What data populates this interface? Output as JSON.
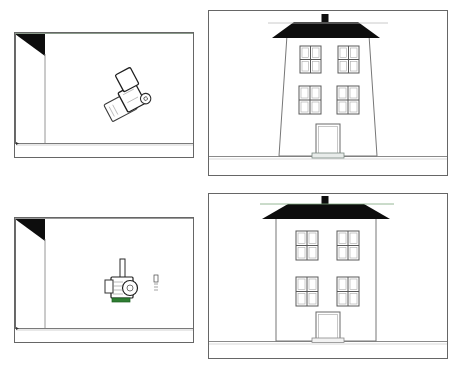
{
  "document": {
    "title": "Architectural Sketch Comparison Sheet",
    "background_color": "#ffffff",
    "width": 461,
    "height": 368,
    "line_color": "#555555",
    "ink_color": "#111111",
    "fill_color": "#ffffff"
  },
  "layout": {
    "columns": 2,
    "rows": 2,
    "description": "Four line-drawing viewport panels arranged in a 2x2 grid"
  },
  "panels": [
    {
      "id": "interior-top",
      "name": "Interior perspective view - top left",
      "kind": "interior-room",
      "row": 1,
      "column": 1,
      "x": 14,
      "y": 32,
      "width": 180,
      "height": 126,
      "border_color": "#666666",
      "features": {
        "corner_shadow": "black triangle at upper-left wall corner",
        "wall_edge_lines": 2,
        "floor_line_y_ratio": 0.88,
        "object": {
          "name": "furniture-sketch",
          "label": "rotated boxy object",
          "x_ratio": 0.62,
          "y_ratio": 0.58,
          "rotation_deg": -28
        }
      }
    },
    {
      "id": "exterior-top",
      "name": "House elevation - top right (tapered walls)",
      "kind": "house-elevation",
      "row": 1,
      "column": 2,
      "x": 208,
      "y": 10,
      "width": 240,
      "height": 166,
      "border_color": "#666666",
      "house": {
        "wall_style": "tapered",
        "roof_color": "#0d0d0d",
        "chimney": true,
        "stories": 2,
        "windows": 4,
        "window_panes": 4,
        "doors": 1,
        "door_step": true,
        "ground_line": true
      }
    },
    {
      "id": "interior-bottom",
      "name": "Interior perspective view - bottom left",
      "kind": "interior-room",
      "row": 2,
      "column": 1,
      "x": 14,
      "y": 217,
      "width": 180,
      "height": 126,
      "border_color": "#666666",
      "features": {
        "corner_shadow": "black triangle at upper-left wall corner",
        "wall_edge_lines": 2,
        "floor_line_y_ratio": 0.88,
        "object": {
          "name": "machine-sketch",
          "label": "upright machine with green base",
          "x_ratio": 0.62,
          "y_ratio": 0.58,
          "rotation_deg": 0,
          "accent_color": "#2e7d32"
        },
        "annotation": {
          "name": "scale-marker",
          "x_ratio": 0.78,
          "y_ratio": 0.56,
          "text": "|||"
        }
      }
    },
    {
      "id": "exterior-bottom",
      "name": "House elevation - bottom right (vertical walls)",
      "kind": "house-elevation",
      "row": 2,
      "column": 2,
      "x": 208,
      "y": 193,
      "width": 240,
      "height": 166,
      "border_color": "#666666",
      "house": {
        "wall_style": "vertical",
        "roof_color": "#0d0d0d",
        "chimney": true,
        "stories": 2,
        "windows": 4,
        "window_panes": 4,
        "doors": 1,
        "door_step": true,
        "ground_line": true
      }
    }
  ]
}
